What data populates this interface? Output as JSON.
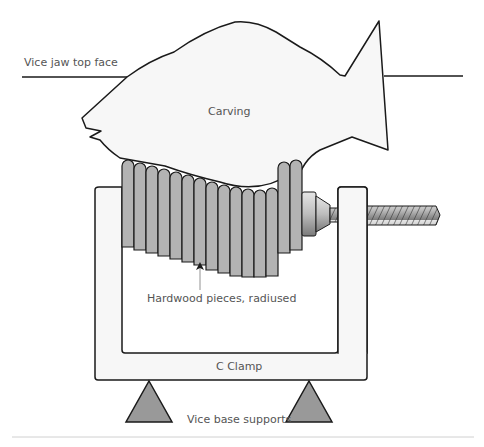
{
  "diagram": {
    "labels": {
      "vice_jaw": "Vice jaw top face",
      "carving": "Carving",
      "hardwood": "Hardwood pieces, radiused",
      "c_clamp": "C Clamp",
      "supports": "Vice base supports"
    },
    "colors": {
      "outline": "#1a1a1a",
      "carving_fill": "#f7f7f7",
      "piece_fill": "#b3b3b3",
      "clamp_fill": "#f7f7f7",
      "support_fill": "#999999",
      "divider": "#d0d0d0"
    },
    "pieces": [
      {
        "x": 122,
        "top": 160,
        "bottom": 247
      },
      {
        "x": 134,
        "top": 163,
        "bottom": 250
      },
      {
        "x": 146,
        "top": 166,
        "bottom": 253
      },
      {
        "x": 158,
        "top": 169,
        "bottom": 256
      },
      {
        "x": 170,
        "top": 172,
        "bottom": 259
      },
      {
        "x": 182,
        "top": 175,
        "bottom": 262
      },
      {
        "x": 194,
        "top": 178,
        "bottom": 265
      },
      {
        "x": 206,
        "top": 182,
        "bottom": 270
      },
      {
        "x": 218,
        "top": 185,
        "bottom": 273
      },
      {
        "x": 230,
        "top": 187,
        "bottom": 276
      },
      {
        "x": 242,
        "top": 189,
        "bottom": 277
      },
      {
        "x": 254,
        "top": 190,
        "bottom": 277
      },
      {
        "x": 266,
        "top": 188,
        "bottom": 276
      },
      {
        "x": 278,
        "top": 162,
        "bottom": 253
      },
      {
        "x": 290,
        "top": 160,
        "bottom": 250
      }
    ]
  }
}
